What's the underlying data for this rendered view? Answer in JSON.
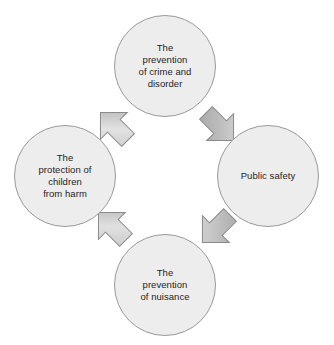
{
  "diagram": {
    "type": "cycle-diagram",
    "background_color": "#ffffff",
    "node_fill_color": "#ededed",
    "node_stroke_color": "#9a9a9a",
    "arrow_fill_light": "#dcdcdc",
    "arrow_fill_dark": "#b0b0b0",
    "arrow_stroke_color": "#8a8a8a",
    "text_color": "#1d1d1d",
    "flow_direction": "clockwise",
    "nodes": [
      {
        "id": "crime-disorder",
        "label": "The\nprevention\nof crime and\ndisorder",
        "position": "top"
      },
      {
        "id": "public-safety",
        "label": "Public safety",
        "position": "right"
      },
      {
        "id": "nuisance",
        "label": "The\nprevention\nof nuisance",
        "position": "bottom"
      },
      {
        "id": "children-harm",
        "label": "The\nprotection of\nchildren\nfrom harm",
        "position": "left"
      }
    ],
    "arrows": [
      {
        "id": "arrow-children-to-crime",
        "from": "children-harm",
        "to": "crime-disorder",
        "direction": "up-right"
      },
      {
        "id": "arrow-crime-to-safety",
        "from": "crime-disorder",
        "to": "public-safety",
        "direction": "down-right"
      },
      {
        "id": "arrow-safety-to-nuisance",
        "from": "public-safety",
        "to": "nuisance",
        "direction": "down-left"
      },
      {
        "id": "arrow-nuisance-to-children",
        "from": "nuisance",
        "to": "children-harm",
        "direction": "up-left"
      }
    ]
  }
}
